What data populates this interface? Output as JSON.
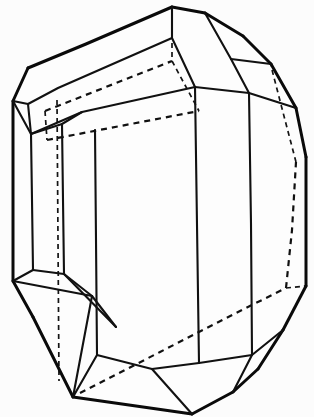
{
  "figure": {
    "caption": "",
    "background_color": "#fcfcfc",
    "line_color": "#111111",
    "hidden_line_style": "dashed",
    "width": 314,
    "height": 417
  },
  "geometry": {
    "visible_outline": "M172,7 L205,13 L243,36 L271,64 L296,108 L306,157 L306,286 L283,330 L258,369 L233,392 L192,414 L145,404 L100,401 L73,397 L33,317 L13,281 L13,101 L28,68 L86,28 Z",
    "solid_edges": [
      {
        "name": "outline-top-left-ridge",
        "d": "M28,68 L172,7"
      },
      {
        "name": "outline-top-apex-right",
        "d": "M172,7 L205,13"
      },
      {
        "name": "outline-upper-right-a",
        "d": "M205,13 L243,36"
      },
      {
        "name": "outline-upper-right-b",
        "d": "M243,36 L271,64"
      },
      {
        "name": "outline-upper-right-c",
        "d": "M271,64 L296,108"
      },
      {
        "name": "outline-upper-right-d",
        "d": "M296,108 L306,157"
      },
      {
        "name": "outline-right-vertical",
        "d": "M306,157 L306,286"
      },
      {
        "name": "outline-lower-right-a",
        "d": "M306,286 L283,330"
      },
      {
        "name": "outline-lower-right-b",
        "d": "M283,330 L258,369"
      },
      {
        "name": "outline-lower-right-c",
        "d": "M258,369 L233,392"
      },
      {
        "name": "outline-bottom-a",
        "d": "M233,392 L192,414"
      },
      {
        "name": "outline-bottom-b",
        "d": "M192,414 L73,397"
      },
      {
        "name": "outline-lower-left-a",
        "d": "M73,397 L33,317"
      },
      {
        "name": "outline-lower-left-b",
        "d": "M33,317 L13,281"
      },
      {
        "name": "outline-left-vertical",
        "d": "M13,281 L13,101"
      },
      {
        "name": "outline-upper-left-a",
        "d": "M13,101 L28,68"
      },
      {
        "name": "ridge-front-top",
        "d": "M28,104 L55,86 L172,38"
      },
      {
        "name": "ridge-front-lower",
        "d": "M30,133 L82,110 L195,87"
      },
      {
        "name": "apex-to-front-top",
        "d": "M172,7 L172,38"
      },
      {
        "name": "apex-ridge-right",
        "d": "M172,38 L195,87"
      },
      {
        "name": "top-right-facet-a",
        "d": "M205,13 L232,60"
      },
      {
        "name": "top-right-facet-b",
        "d": "M232,60 L249,93"
      },
      {
        "name": "top-right-facet-c",
        "d": "M195,87 L249,93"
      },
      {
        "name": "top-right-facet-d",
        "d": "M232,60 L271,64"
      },
      {
        "name": "left-facet-upper",
        "d": "M13,101 L28,104"
      },
      {
        "name": "left-facet-lower",
        "d": "M13,101 L30,133"
      },
      {
        "name": "left-pillar-inner",
        "d": "M28,104 L30,133"
      },
      {
        "name": "left-col-a",
        "d": "M30,133 L33,270"
      },
      {
        "name": "left-col-b",
        "d": "M62,123 L64,274"
      },
      {
        "name": "left-col-split",
        "d": "M28,104 L30,133"
      },
      {
        "name": "left-col-inner-top",
        "d": "M62,123 L82,110"
      },
      {
        "name": "left-bottom-facet-a",
        "d": "M13,281 L33,270"
      },
      {
        "name": "left-bottom-facet-b",
        "d": "M33,270 L64,274"
      },
      {
        "name": "left-bottom-facet-c",
        "d": "M64,274 L92,296"
      },
      {
        "name": "left-bottom-facet-d",
        "d": "M13,281 L92,296"
      },
      {
        "name": "left-bottom-facet-e",
        "d": "M92,296 L73,397"
      },
      {
        "name": "left-bottom-wedge",
        "d": "M64,274 L116,326"
      },
      {
        "name": "left-bottom-wedge-b",
        "d": "M92,296 L116,326"
      },
      {
        "name": "front-left-col",
        "d": "M95,130 L97,355"
      },
      {
        "name": "front-mid-col",
        "d": "M195,87 L199,363"
      },
      {
        "name": "front-right-col",
        "d": "M249,93 L252,355"
      },
      {
        "name": "bottom-front-facet-a",
        "d": "M97,355 L152,369"
      },
      {
        "name": "bottom-front-facet-b",
        "d": "M152,369 L199,363"
      },
      {
        "name": "bottom-front-facet-c",
        "d": "M199,363 L252,355"
      },
      {
        "name": "bottom-front-facet-d",
        "d": "M152,369 L192,414"
      },
      {
        "name": "bottom-front-facet-e",
        "d": "M73,397 L97,355"
      },
      {
        "name": "bottom-front-facet-f",
        "d": "M252,355 L233,392"
      },
      {
        "name": "bottom-right-facet",
        "d": "M252,355 L283,330"
      },
      {
        "name": "right-upper-join",
        "d": "M249,93 L296,108"
      }
    ],
    "hidden_edges": [
      {
        "name": "hidden-back-top-ridge",
        "d": "M45,111 L172,61"
      },
      {
        "name": "hidden-back-lower-ridge",
        "d": "M47,140 L199,111"
      },
      {
        "name": "hidden-back-apex-vert",
        "d": "M172,7 L172,61"
      },
      {
        "name": "hidden-back-apex-to-lower",
        "d": "M172,61 L199,111"
      },
      {
        "name": "hidden-back-left-vert",
        "d": "M45,111 L47,140"
      },
      {
        "name": "hidden-back-pillar",
        "d": "M57,103 L59,380"
      },
      {
        "name": "hidden-back-bottom-diag",
        "d": "M80,393 L285,288"
      },
      {
        "name": "hidden-back-right-vert",
        "d": "M285,288 L296,160"
      },
      {
        "name": "hidden-back-right-upper",
        "d": "M296,160 L271,64"
      },
      {
        "name": "hidden-back-bottom-right",
        "d": "M285,288 L306,286"
      }
    ]
  }
}
